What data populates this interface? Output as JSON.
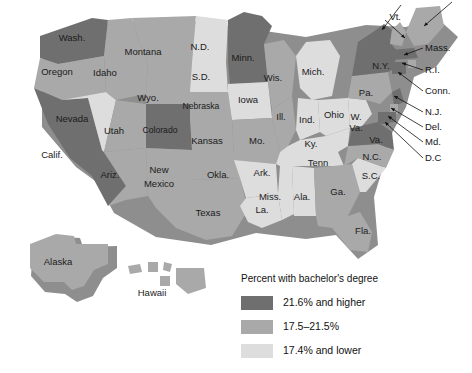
{
  "figure": {
    "type": "choropleth-map",
    "region": "United States",
    "background_color": "#ffffff"
  },
  "legend": {
    "title": "Percent with bachelor's degree",
    "entries": [
      {
        "label": "21.6% and higher",
        "color": "#6f6f6f",
        "bin": "high"
      },
      {
        "label": "17.5–21.5%",
        "color": "#a9a9a9",
        "bin": "mid"
      },
      {
        "label": "17.4% and lower",
        "color": "#dddddd",
        "bin": "low"
      }
    ]
  },
  "palette": {
    "high": "#6f6f6f",
    "mid": "#a9a9a9",
    "low": "#dddddd",
    "border": "#ffffff",
    "shadow": "#6b6b6b",
    "text": "#1b1b1b"
  },
  "chart_data": {
    "type": "map",
    "title": "Percent with bachelor's degree",
    "legend_position": "bottom-right",
    "bins": [
      {
        "name": "21.6% and higher",
        "color": "#6f6f6f"
      },
      {
        "name": "17.5–21.5%",
        "color": "#a9a9a9"
      },
      {
        "name": "17.4% and lower",
        "color": "#dddddd"
      }
    ],
    "states": [
      {
        "label": "Wash.",
        "bin": "high",
        "labeled_on_map": true
      },
      {
        "label": "Oregon",
        "bin": "mid",
        "labeled_on_map": true
      },
      {
        "label": "Idaho",
        "bin": "mid",
        "labeled_on_map": true
      },
      {
        "label": "Montana",
        "bin": "mid",
        "labeled_on_map": true
      },
      {
        "label": "Wyo.",
        "bin": "mid",
        "labeled_on_map": true
      },
      {
        "label": "N.D.",
        "bin": "low",
        "labeled_on_map": true
      },
      {
        "label": "S.D.",
        "bin": "low",
        "labeled_on_map": true
      },
      {
        "label": "Minn.",
        "bin": "high",
        "labeled_on_map": true
      },
      {
        "label": "Wis.",
        "bin": "mid",
        "labeled_on_map": true
      },
      {
        "label": "Mich.",
        "bin": "low",
        "labeled_on_map": true
      },
      {
        "label": "Nevada",
        "bin": "low",
        "labeled_on_map": true
      },
      {
        "label": "Utah",
        "bin": "mid",
        "labeled_on_map": true
      },
      {
        "label": "Colorado",
        "bin": "high",
        "labeled_on_map": true
      },
      {
        "label": "Nebraska",
        "bin": "mid",
        "labeled_on_map": true
      },
      {
        "label": "Iowa",
        "bin": "low",
        "labeled_on_map": true
      },
      {
        "label": "Ill.",
        "bin": "mid",
        "labeled_on_map": true
      },
      {
        "label": "Ind.",
        "bin": "low",
        "labeled_on_map": true
      },
      {
        "label": "Ohio",
        "bin": "low",
        "labeled_on_map": true
      },
      {
        "label": "Calif.",
        "bin": "high",
        "labeled_on_map": true
      },
      {
        "label": "Ariz.",
        "bin": "mid",
        "labeled_on_map": true
      },
      {
        "label": "New Mexico",
        "bin": "mid",
        "labeled_on_map": true
      },
      {
        "label": "Kansas",
        "bin": "mid",
        "labeled_on_map": true
      },
      {
        "label": "Mo.",
        "bin": "mid",
        "labeled_on_map": true
      },
      {
        "label": "Ky.",
        "bin": "low",
        "labeled_on_map": true
      },
      {
        "label": "W. Va.",
        "bin": "low",
        "labeled_on_map": true
      },
      {
        "label": "Va.",
        "bin": "high",
        "labeled_on_map": true
      },
      {
        "label": "Okla.",
        "bin": "mid",
        "labeled_on_map": true
      },
      {
        "label": "Ark.",
        "bin": "low",
        "labeled_on_map": true
      },
      {
        "label": "Tenn",
        "bin": "low",
        "labeled_on_map": true
      },
      {
        "label": "N.C.",
        "bin": "mid",
        "labeled_on_map": true
      },
      {
        "label": "S.C.",
        "bin": "low",
        "labeled_on_map": true
      },
      {
        "label": "Texas",
        "bin": "mid",
        "labeled_on_map": true
      },
      {
        "label": "La.",
        "bin": "low",
        "labeled_on_map": true
      },
      {
        "label": "Miss.",
        "bin": "low",
        "labeled_on_map": true
      },
      {
        "label": "Ala.",
        "bin": "low",
        "labeled_on_map": true
      },
      {
        "label": "Ga.",
        "bin": "mid",
        "labeled_on_map": true
      },
      {
        "label": "Fla.",
        "bin": "mid",
        "labeled_on_map": true
      },
      {
        "label": "Pa.",
        "bin": "mid",
        "labeled_on_map": true
      },
      {
        "label": "N.Y.",
        "bin": "high",
        "labeled_on_map": true
      },
      {
        "label": "Alaska",
        "bin": "mid",
        "labeled_on_map": true
      },
      {
        "label": "Hawaii",
        "bin": "mid",
        "labeled_on_map": true
      },
      {
        "label": "Vt.",
        "bin": "high",
        "labeled_on_map": true,
        "callout": true
      },
      {
        "label": "Mass.",
        "bin": "high",
        "labeled_on_map": true,
        "callout": true
      },
      {
        "label": "R.I.",
        "bin": "mid",
        "labeled_on_map": true,
        "callout": true
      },
      {
        "label": "Conn.",
        "bin": "high",
        "labeled_on_map": true,
        "callout": true
      },
      {
        "label": "N.J.",
        "bin": "high",
        "labeled_on_map": true,
        "callout": true
      },
      {
        "label": "Del.",
        "bin": "mid",
        "labeled_on_map": true,
        "callout": true
      },
      {
        "label": "Md.",
        "bin": "high",
        "labeled_on_map": true,
        "callout": true
      },
      {
        "label": "D.C",
        "bin": "high",
        "labeled_on_map": true,
        "callout": true
      }
    ]
  },
  "map_labels": {
    "inline": [
      {
        "name": "wash",
        "text": "Wash.",
        "x": 72,
        "y": 38
      },
      {
        "name": "oregon",
        "text": "Oregon",
        "x": 57,
        "y": 72
      },
      {
        "name": "idaho",
        "text": "Idaho",
        "x": 105,
        "y": 73
      },
      {
        "name": "montana",
        "text": "Montana",
        "x": 143,
        "y": 52
      },
      {
        "name": "wyo",
        "text": "Wyo.",
        "x": 148,
        "y": 98
      },
      {
        "name": "nd",
        "text": "N.D.",
        "x": 200,
        "y": 47
      },
      {
        "name": "sd",
        "text": "S.D.",
        "x": 201,
        "y": 77
      },
      {
        "name": "minn",
        "text": "Minn.",
        "x": 243,
        "y": 58
      },
      {
        "name": "wis",
        "text": "Wis.",
        "x": 273,
        "y": 78
      },
      {
        "name": "mich",
        "text": "Mich.",
        "x": 313,
        "y": 72
      },
      {
        "name": "nevada",
        "text": "Nevada",
        "x": 72,
        "y": 119
      },
      {
        "name": "utah",
        "text": "Utah",
        "x": 114,
        "y": 131
      },
      {
        "name": "colorado",
        "text": "Colorado",
        "x": 160,
        "y": 131
      },
      {
        "name": "nebraska",
        "text": "Nebraska",
        "x": 201,
        "y": 107
      },
      {
        "name": "iowa",
        "text": "Iowa",
        "x": 248,
        "y": 100
      },
      {
        "name": "ill",
        "text": "Ill.",
        "x": 281,
        "y": 117
      },
      {
        "name": "ind",
        "text": "Ind.",
        "x": 307,
        "y": 120
      },
      {
        "name": "ohio",
        "text": "Ohio",
        "x": 334,
        "y": 115
      },
      {
        "name": "calif",
        "text": "Calif.",
        "x": 52,
        "y": 155
      },
      {
        "name": "ariz",
        "text": "Ariz.",
        "x": 110,
        "y": 175
      },
      {
        "name": "newmexico1",
        "text": "New",
        "x": 159,
        "y": 170
      },
      {
        "name": "newmexico2",
        "text": "Mexico",
        "x": 159,
        "y": 184
      },
      {
        "name": "kansas",
        "text": "Kansas",
        "x": 207,
        "y": 141
      },
      {
        "name": "mo",
        "text": "Mo.",
        "x": 257,
        "y": 141
      },
      {
        "name": "wva1",
        "text": "W.",
        "x": 356,
        "y": 117
      },
      {
        "name": "wva2",
        "text": "Va.",
        "x": 356,
        "y": 128
      },
      {
        "name": "va",
        "text": "Va.",
        "x": 376,
        "y": 140
      },
      {
        "name": "ky",
        "text": "Ky.",
        "x": 311,
        "y": 144
      },
      {
        "name": "tenn",
        "text": "Tenn",
        "x": 318,
        "y": 163
      },
      {
        "name": "okla",
        "text": "Okla.",
        "x": 218,
        "y": 175
      },
      {
        "name": "ark",
        "text": "Ark.",
        "x": 262,
        "y": 173
      },
      {
        "name": "nc",
        "text": "N.C.",
        "x": 372,
        "y": 157
      },
      {
        "name": "sc",
        "text": "S.C.",
        "x": 371,
        "y": 176
      },
      {
        "name": "miss",
        "text": "Miss.",
        "x": 270,
        "y": 197
      },
      {
        "name": "ala",
        "text": "Ala.",
        "x": 302,
        "y": 197
      },
      {
        "name": "ga",
        "text": "Ga.",
        "x": 338,
        "y": 192
      },
      {
        "name": "texas",
        "text": "Texas",
        "x": 208,
        "y": 213
      },
      {
        "name": "la",
        "text": "La.",
        "x": 262,
        "y": 210
      },
      {
        "name": "fla",
        "text": "Fla.",
        "x": 363,
        "y": 231
      },
      {
        "name": "pa",
        "text": "Pa.",
        "x": 366,
        "y": 93
      },
      {
        "name": "ny",
        "text": "N.Y.",
        "x": 381,
        "y": 66
      },
      {
        "name": "alaska",
        "text": "Alaska",
        "x": 58,
        "y": 262
      },
      {
        "name": "hawaii",
        "text": "Hawaii",
        "x": 152,
        "y": 293
      }
    ],
    "callouts": [
      {
        "name": "vt",
        "text": "Vt.",
        "tx": 401,
        "ty": 17,
        "align": "left",
        "lx1": 385,
        "ly1": 20,
        "lx2": 405,
        "ly2": 38
      },
      {
        "name": "nh",
        "text": "",
        "tx": 0,
        "ty": 0,
        "align": "left",
        "lx1": 401,
        "ly1": 5,
        "lx2": 382,
        "ly2": 30
      },
      {
        "name": "maine",
        "text": "",
        "tx": 0,
        "ty": 0,
        "align": "left",
        "lx1": 452,
        "ly1": 2,
        "lx2": 424,
        "ly2": 26
      },
      {
        "name": "mass",
        "text": "Mass.",
        "tx": 425,
        "ty": 48,
        "align": "right",
        "lx1": 423,
        "ly1": 48,
        "lx2": 404,
        "ly2": 55
      },
      {
        "name": "ri",
        "text": "R.I.",
        "tx": 425,
        "ty": 70,
        "align": "right",
        "lx1": 423,
        "ly1": 70,
        "lx2": 402,
        "ly2": 63
      },
      {
        "name": "conn",
        "text": "Conn.",
        "tx": 425,
        "ty": 91,
        "align": "right",
        "lx1": 423,
        "ly1": 91,
        "lx2": 398,
        "ly2": 72
      },
      {
        "name": "nj",
        "text": "N.J.",
        "tx": 425,
        "ty": 112,
        "align": "right",
        "lx1": 423,
        "ly1": 112,
        "lx2": 394,
        "ly2": 96
      },
      {
        "name": "del",
        "text": "Del.",
        "tx": 425,
        "ty": 127,
        "align": "right",
        "lx1": 423,
        "ly1": 127,
        "lx2": 391,
        "ly2": 108
      },
      {
        "name": "md",
        "text": "Md.",
        "tx": 425,
        "ty": 142,
        "align": "right",
        "lx1": 423,
        "ly1": 142,
        "lx2": 388,
        "ly2": 116
      },
      {
        "name": "dc",
        "text": "D.C",
        "tx": 425,
        "ty": 158,
        "align": "right",
        "lx1": 423,
        "ly1": 158,
        "lx2": 385,
        "ly2": 122
      }
    ]
  }
}
